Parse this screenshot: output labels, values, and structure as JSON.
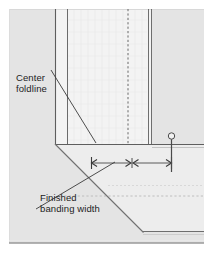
{
  "figure": {
    "type": "technical-sewing-diagram",
    "background_color": "#ffffff",
    "fabric_fill": "#e3e3e3",
    "band_fill": "#f2f2f2",
    "line_color": "#6f6f6f",
    "dark_line_color": "#3a3a3a",
    "text_color": "#1c1c1c"
  },
  "labels": {
    "center_foldline": {
      "line1": "Center",
      "line2": "foldline"
    },
    "finished_banding_width": {
      "line1": "Finished",
      "line2": "banding width"
    }
  },
  "annotations": {
    "dimension_arrow": {
      "name": "finished-banding-width-dimension",
      "left_tick": "|<",
      "mid_ticks": ">|<",
      "right_tick": ">|",
      "segments": 2
    },
    "pin": {
      "name": "straight-pin",
      "head_shape": "circle"
    }
  },
  "geometry": {
    "outer_rect": {
      "x": 9,
      "y": 9,
      "w": 195,
      "h": 234
    },
    "corner_point": {
      "x": 55,
      "y": 144
    },
    "band_left_edge_x": 55,
    "band_inner_edge_x": 67,
    "band_foldline_x": 128,
    "band_right_edge_x": 148,
    "band_right_edge2_x": 152,
    "horizontal_band_top_y": 144,
    "horizontal_band_inner_y": 156,
    "horizontal_foldline_y": 196,
    "horizontal_bottom_y": 231,
    "miter_start": {
      "x": 55,
      "y": 144
    },
    "miter_end": {
      "x": 143,
      "y": 232
    },
    "dimension_line_y": 163,
    "dimension_left_x": 91,
    "dimension_mid_x": 132,
    "dimension_right_x": 172
  }
}
